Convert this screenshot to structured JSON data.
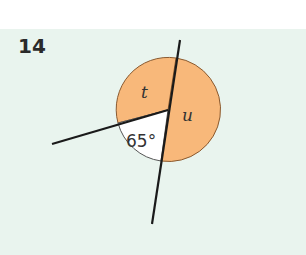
{
  "question": {
    "number": "14"
  },
  "diagram": {
    "angle_labels": {
      "t": "t",
      "u": "u",
      "given": "65°"
    },
    "colors": {
      "background": "#e9f4ee",
      "shaded": "#f8b87a",
      "line": "#1a1a1a",
      "arc": "#555555"
    }
  }
}
